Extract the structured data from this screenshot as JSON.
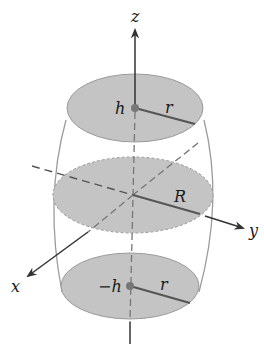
{
  "diagram": {
    "colors": {
      "disk_fill": "#c4c4c4",
      "disk_edge": "#9a9a9a",
      "axis": "#333333",
      "radius_line": "#555555",
      "barrel_outline": "#9c9c9c",
      "dashed": "#777777"
    },
    "axes": {
      "z": {
        "label": "z"
      },
      "y": {
        "label": "y"
      },
      "x": {
        "label": "x"
      }
    },
    "cross_sections": [
      {
        "name": "top",
        "height_label": "h",
        "radius_label": "r"
      },
      {
        "name": "middle",
        "height_label": "",
        "radius_label": "R"
      },
      {
        "name": "bottom",
        "height_label": "−h",
        "radius_label": "r"
      }
    ]
  }
}
